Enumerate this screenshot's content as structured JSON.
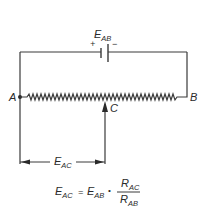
{
  "diagram": {
    "source": {
      "label_main": "E",
      "label_sub": "AB",
      "plus": "+",
      "minus": "−"
    },
    "nodes": {
      "a": "A",
      "b": "B",
      "c": "C"
    },
    "dimension": {
      "label_main": "E",
      "label_sub": "AC"
    },
    "formula": {
      "lhs_main": "E",
      "lhs_sub": "AC",
      "equals": "=",
      "term_main": "E",
      "term_sub": "AB",
      "times": "•",
      "num_main": "R",
      "num_sub": "AC",
      "den_main": "R",
      "den_sub": "AB"
    },
    "colors": {
      "line": "#3a3a3a",
      "text": "#2a2a2a",
      "background": "#ffffff"
    }
  }
}
